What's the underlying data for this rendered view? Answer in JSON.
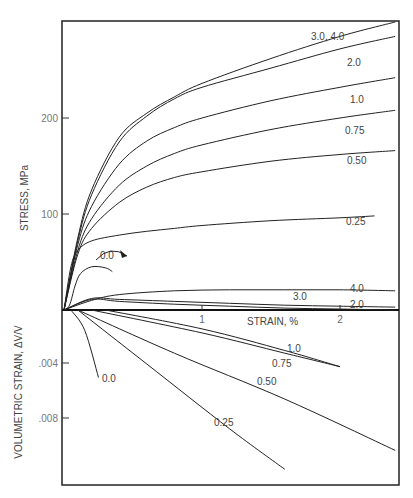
{
  "page_header": {
    "text": "",
    "page_number": ""
  },
  "chart_data": [
    {
      "type": "line",
      "title": "",
      "xlabel": "STRAIN, %",
      "ylabel": "STRESS, MPa",
      "xlim": [
        0,
        2.4
      ],
      "ylim": [
        0,
        320
      ],
      "yticks": [
        {
          "value": 100,
          "label": "100"
        },
        {
          "value": 200,
          "label": "200"
        }
      ],
      "xticks": [
        {
          "value": 1,
          "label": "1"
        },
        {
          "value": 2,
          "label": "2"
        }
      ],
      "grid": false,
      "legend": "inline curve labels",
      "series": [
        {
          "name": "3.0, 4.0",
          "label": "3.0, 4.0",
          "x": [
            0,
            0.1,
            0.2,
            0.4,
            0.6,
            0.8,
            1.0,
            1.5,
            2.0,
            2.4
          ],
          "y": [
            0,
            75,
            125,
            180,
            205,
            222,
            236,
            262,
            285,
            300
          ]
        },
        {
          "name": "2.0",
          "label": "2.0",
          "x": [
            0,
            0.1,
            0.2,
            0.4,
            0.6,
            0.8,
            1.0,
            1.5,
            2.0,
            2.4
          ],
          "y": [
            0,
            72,
            120,
            175,
            202,
            220,
            232,
            252,
            272,
            285
          ]
        },
        {
          "name": "1.0",
          "label": "1.0",
          "x": [
            0,
            0.1,
            0.2,
            0.4,
            0.6,
            0.8,
            1.0,
            1.5,
            2.0,
            2.4
          ],
          "y": [
            0,
            68,
            108,
            152,
            176,
            190,
            200,
            218,
            232,
            242
          ]
        },
        {
          "name": "0.75",
          "label": "0.75",
          "x": [
            0,
            0.1,
            0.2,
            0.4,
            0.6,
            0.8,
            1.0,
            1.5,
            2.0,
            2.4
          ],
          "y": [
            0,
            62,
            95,
            130,
            150,
            163,
            172,
            188,
            200,
            208
          ]
        },
        {
          "name": "0.50",
          "label": "0.50",
          "x": [
            0,
            0.1,
            0.2,
            0.4,
            0.6,
            0.8,
            1.0,
            1.5,
            2.0,
            2.4
          ],
          "y": [
            0,
            58,
            85,
            112,
            128,
            138,
            144,
            155,
            162,
            166
          ]
        },
        {
          "name": "0.25",
          "label": "0.25",
          "x": [
            0,
            0.05,
            0.1,
            0.2,
            0.4,
            0.6,
            0.8,
            1.0,
            1.5,
            2.0,
            2.25
          ],
          "y": [
            0,
            45,
            62,
            72,
            78,
            82,
            85,
            88,
            93,
            96,
            98
          ]
        },
        {
          "name": "0.0",
          "label": "0.0",
          "x": [
            0,
            0.04,
            0.08,
            0.12,
            0.2,
            0.3,
            0.35
          ],
          "y": [
            0,
            5,
            25,
            38,
            45,
            44,
            40
          ]
        },
        {
          "name": "4.0 (low)",
          "label": "4.0",
          "x": [
            0,
            0.2,
            0.4,
            0.8,
            1.2,
            1.6,
            2.0,
            2.4
          ],
          "y": [
            0,
            10,
            16,
            20,
            21,
            21,
            21,
            20
          ]
        },
        {
          "name": "3.0 (low)",
          "label": "3.0",
          "x": [
            0,
            0.2,
            0.4,
            0.8,
            1.2,
            1.6,
            2.0,
            2.4
          ],
          "y": [
            0,
            12,
            11,
            9,
            7,
            5,
            4,
            3
          ]
        },
        {
          "name": "2.0 (low)",
          "label": "2.0",
          "x": [
            0,
            0.2,
            0.4,
            0.8,
            1.2,
            1.6,
            2.0,
            2.4
          ],
          "y": [
            0,
            11,
            9,
            6,
            4,
            2,
            1,
            0
          ]
        }
      ]
    },
    {
      "type": "line",
      "title": "",
      "xlabel": "STRAIN, %",
      "ylabel": "VOLUMETRIC STRAIN, ΔV/V",
      "xlim": [
        0,
        2.4
      ],
      "ylim": [
        0,
        0.0128
      ],
      "yticks": [
        {
          "value": 0.004,
          "label": ".004"
        },
        {
          "value": 0.008,
          "label": ".008"
        }
      ],
      "inverted_y": true,
      "series": [
        {
          "name": "0.0",
          "label": "0.0",
          "x": [
            0.05,
            0.15,
            0.25
          ],
          "y": [
            0,
            0.0015,
            0.005
          ]
        },
        {
          "name": "0.25",
          "label": "0.25",
          "x": [
            0.1,
            0.6,
            1.2,
            1.6
          ],
          "y": [
            0,
            0.004,
            0.0088,
            0.0118
          ]
        },
        {
          "name": "0.50",
          "label": "0.50",
          "x": [
            0.1,
            0.8,
            1.6,
            2.4
          ],
          "y": [
            0,
            0.0032,
            0.0066,
            0.0104
          ]
        },
        {
          "name": "0.75",
          "label": "0.75",
          "x": [
            0.2,
            1.0,
            1.6,
            2.0
          ],
          "y": [
            0,
            0.0017,
            0.0032,
            0.0042
          ]
        },
        {
          "name": "1.0",
          "label": "1.0",
          "x": [
            0.3,
            1.0,
            1.6,
            2.0
          ],
          "y": [
            0,
            0.0014,
            0.003,
            0.0042
          ]
        }
      ]
    }
  ],
  "axes": {
    "stress_label": "STRESS, MPa",
    "volumetric_label": "VOLUMETRIC STRAIN, ΔV/V",
    "strain_label": "STRAIN, %",
    "stress_ticks": [
      "100",
      "200"
    ],
    "vol_ticks": [
      ".004",
      ".008"
    ],
    "strain_ticks": [
      "1",
      "2"
    ]
  }
}
